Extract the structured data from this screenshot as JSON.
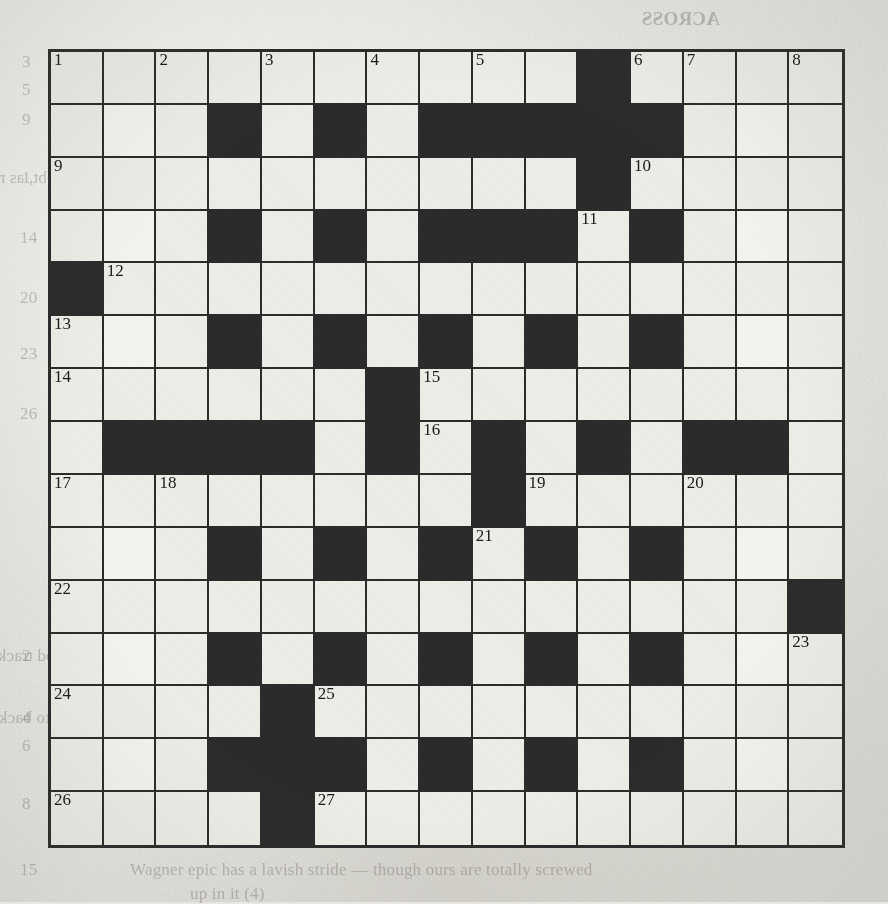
{
  "puzzle": {
    "type": "crossword-grid",
    "rows": 15,
    "cols": 15,
    "ink_color": "#2b2b2b",
    "paper_color": "#e9e8e3",
    "cell_color": "#edece7",
    "black_cells": [
      [
        1,
        11
      ],
      [
        2,
        4
      ],
      [
        2,
        6
      ],
      [
        2,
        8
      ],
      [
        2,
        9
      ],
      [
        2,
        10
      ],
      [
        2,
        11
      ],
      [
        2,
        12
      ],
      [
        3,
        11
      ],
      [
        4,
        4
      ],
      [
        4,
        6
      ],
      [
        4,
        8
      ],
      [
        4,
        9
      ],
      [
        4,
        10
      ],
      [
        4,
        12
      ],
      [
        5,
        1
      ],
      [
        6,
        4
      ],
      [
        6,
        6
      ],
      [
        6,
        8
      ],
      [
        6,
        10
      ],
      [
        6,
        12
      ],
      [
        7,
        7
      ],
      [
        8,
        2
      ],
      [
        8,
        3
      ],
      [
        8,
        4
      ],
      [
        8,
        5
      ],
      [
        8,
        7
      ],
      [
        8,
        9
      ],
      [
        8,
        11
      ],
      [
        8,
        13
      ],
      [
        8,
        14
      ],
      [
        9,
        9
      ],
      [
        10,
        4
      ],
      [
        10,
        6
      ],
      [
        10,
        8
      ],
      [
        10,
        10
      ],
      [
        10,
        12
      ],
      [
        11,
        15
      ],
      [
        12,
        4
      ],
      [
        12,
        6
      ],
      [
        12,
        8
      ],
      [
        12,
        10
      ],
      [
        12,
        12
      ],
      [
        13,
        5
      ],
      [
        14,
        4
      ],
      [
        14,
        5
      ],
      [
        14,
        6
      ],
      [
        14,
        8
      ],
      [
        14,
        10
      ],
      [
        14,
        12
      ],
      [
        15,
        5
      ]
    ],
    "highlight_cells": [
      [
        2,
        2
      ],
      [
        2,
        14
      ],
      [
        4,
        2
      ],
      [
        4,
        14
      ],
      [
        6,
        2
      ],
      [
        6,
        14
      ],
      [
        10,
        2
      ],
      [
        10,
        14
      ],
      [
        12,
        2
      ],
      [
        12,
        14
      ],
      [
        14,
        2
      ],
      [
        14,
        14
      ]
    ],
    "numbers": [
      {
        "n": "1",
        "row": 1,
        "col": 1
      },
      {
        "n": "2",
        "row": 1,
        "col": 3
      },
      {
        "n": "3",
        "row": 1,
        "col": 5
      },
      {
        "n": "4",
        "row": 1,
        "col": 7
      },
      {
        "n": "5",
        "row": 1,
        "col": 9
      },
      {
        "n": "6",
        "row": 1,
        "col": 12
      },
      {
        "n": "7",
        "row": 1,
        "col": 13
      },
      {
        "n": "8",
        "row": 1,
        "col": 15
      },
      {
        "n": "9",
        "row": 3,
        "col": 1
      },
      {
        "n": "10",
        "row": 3,
        "col": 12
      },
      {
        "n": "11",
        "row": 4,
        "col": 11
      },
      {
        "n": "12",
        "row": 5,
        "col": 2
      },
      {
        "n": "13",
        "row": 6,
        "col": 1
      },
      {
        "n": "14",
        "row": 7,
        "col": 1
      },
      {
        "n": "15",
        "row": 7,
        "col": 8
      },
      {
        "n": "16",
        "row": 8,
        "col": 8
      },
      {
        "n": "17",
        "row": 9,
        "col": 1
      },
      {
        "n": "18",
        "row": 9,
        "col": 3
      },
      {
        "n": "19",
        "row": 9,
        "col": 10
      },
      {
        "n": "20",
        "row": 9,
        "col": 13
      },
      {
        "n": "21",
        "row": 10,
        "col": 9
      },
      {
        "n": "22",
        "row": 11,
        "col": 1
      },
      {
        "n": "23",
        "row": 12,
        "col": 15
      },
      {
        "n": "24",
        "row": 13,
        "col": 1
      },
      {
        "n": "25",
        "row": 13,
        "col": 6
      },
      {
        "n": "26",
        "row": 15,
        "col": 1
      },
      {
        "n": "27",
        "row": 15,
        "col": 6
      }
    ]
  },
  "bleed_through": {
    "note": "faint mirrored text showing through from the reverse side of the newspaper page",
    "items": [
      {
        "text": "ACROSS",
        "x": 720,
        "y": 8,
        "size": 19,
        "mirror": true,
        "weight": "bold"
      },
      {
        "text": "Cat in a pot, perhaps (6)",
        "x": 440,
        "y": 52,
        "size": 17,
        "mirror": true,
        "weight": "normal"
      },
      {
        "text": "Enough, I reckon, to wed a girl (5)",
        "x": 430,
        "y": 80,
        "size": 17,
        "mirror": true,
        "weight": "normal"
      },
      {
        "text": "Posing as a trendy chap (4)",
        "x": 470,
        "y": 110,
        "size": 17,
        "mirror": true,
        "weight": "normal"
      },
      {
        "text": "the outfit (5)",
        "x": 560,
        "y": 136,
        "size": 17,
        "mirror": true,
        "weight": "normal"
      },
      {
        "text": "Sank getting drop in debt, as regularly given (6)",
        "x": 210,
        "y": 168,
        "size": 17,
        "mirror": true,
        "weight": "normal"
      },
      {
        "text": "name taken to appear (5)",
        "x": 440,
        "y": 196,
        "size": 17,
        "mirror": true,
        "weight": "normal"
      },
      {
        "text": "Cruel would-be prince (3)",
        "x": 250,
        "y": 228,
        "size": 17,
        "mirror": true,
        "weight": "normal"
      },
      {
        "text": "Stolen clue, not a copy or in truth (4)",
        "x": 330,
        "y": 262,
        "size": 17,
        "mirror": true,
        "weight": "normal"
      },
      {
        "text": "the demented is music dealer (5)",
        "x": 310,
        "y": 288,
        "size": 17,
        "mirror": true,
        "weight": "normal"
      },
      {
        "text": "rattle about your pain cure (7)",
        "x": 330,
        "y": 318,
        "size": 17,
        "mirror": true,
        "weight": "normal"
      },
      {
        "text": "Easy as boy",
        "x": 400,
        "y": 344,
        "size": 17,
        "mirror": true,
        "weight": "normal"
      },
      {
        "text": "part drive-under (6)",
        "x": 330,
        "y": 378,
        "size": 17,
        "mirror": true,
        "weight": "normal"
      },
      {
        "text": "I first to part here to half over",
        "x": 300,
        "y": 404,
        "size": 17,
        "mirror": true,
        "weight": "normal"
      },
      {
        "text": "an eye (6)",
        "x": 430,
        "y": 436,
        "size": 17,
        "mirror": true,
        "weight": "normal"
      },
      {
        "text": "DOWN",
        "x": 700,
        "y": 592,
        "size": 19,
        "mirror": true,
        "weight": "bold"
      },
      {
        "text": "Almost once it got into a good track, I've found",
        "x": 250,
        "y": 646,
        "size": 17,
        "mirror": true,
        "weight": "normal"
      },
      {
        "text": "Early type of man to back in Europe seen for another (6)",
        "x": 180,
        "y": 708,
        "size": 17,
        "mirror": true,
        "weight": "normal"
      },
      {
        "text": "another land piece wants to run",
        "x": 300,
        "y": 736,
        "size": 17,
        "mirror": true,
        "weight": "normal"
      },
      {
        "text": "Quite a bit subs the third in at the",
        "x": 290,
        "y": 764,
        "size": 17,
        "mirror": true,
        "weight": "normal"
      },
      {
        "text": "point, mostly inshore (3)",
        "x": 290,
        "y": 794,
        "size": 17,
        "mirror": true,
        "weight": "normal"
      },
      {
        "text": "Wagner epic has a lavish stride — though ours are totally screwed",
        "x": 130,
        "y": 860,
        "size": 17,
        "mirror": false,
        "weight": "normal"
      },
      {
        "text": "up in it (4)",
        "x": 190,
        "y": 884,
        "size": 17,
        "mirror": false,
        "weight": "normal"
      },
      {
        "text": "3",
        "x": 22,
        "y": 52,
        "size": 17,
        "mirror": false,
        "weight": "normal"
      },
      {
        "text": "5",
        "x": 22,
        "y": 80,
        "size": 17,
        "mirror": false,
        "weight": "normal"
      },
      {
        "text": "9",
        "x": 22,
        "y": 110,
        "size": 17,
        "mirror": false,
        "weight": "normal"
      },
      {
        "text": "1",
        "x": 22,
        "y": 168,
        "size": 17,
        "mirror": false,
        "weight": "normal"
      },
      {
        "text": "14",
        "x": 20,
        "y": 228,
        "size": 17,
        "mirror": false,
        "weight": "normal"
      },
      {
        "text": "20",
        "x": 20,
        "y": 288,
        "size": 17,
        "mirror": false,
        "weight": "normal"
      },
      {
        "text": "23",
        "x": 20,
        "y": 344,
        "size": 17,
        "mirror": false,
        "weight": "normal"
      },
      {
        "text": "26",
        "x": 20,
        "y": 404,
        "size": 17,
        "mirror": false,
        "weight": "normal"
      },
      {
        "text": "2",
        "x": 22,
        "y": 646,
        "size": 17,
        "mirror": false,
        "weight": "normal"
      },
      {
        "text": "4",
        "x": 22,
        "y": 708,
        "size": 17,
        "mirror": false,
        "weight": "normal"
      },
      {
        "text": "6",
        "x": 22,
        "y": 736,
        "size": 17,
        "mirror": false,
        "weight": "normal"
      },
      {
        "text": "8",
        "x": 22,
        "y": 794,
        "size": 17,
        "mirror": false,
        "weight": "normal"
      },
      {
        "text": "15",
        "x": 20,
        "y": 860,
        "size": 17,
        "mirror": false,
        "weight": "normal"
      }
    ]
  }
}
